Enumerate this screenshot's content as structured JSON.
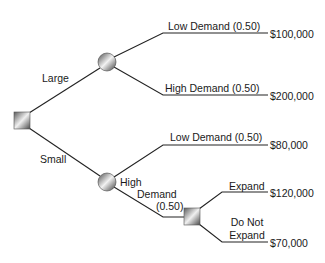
{
  "diagram": {
    "type": "decision-tree",
    "root": {
      "node_type": "decision",
      "branches": [
        {
          "label": "Large",
          "node_type": "chance",
          "outcomes": [
            {
              "label": "Low Demand (0.50)",
              "payoff": "$100,000"
            },
            {
              "label": "High Demand (0.50)",
              "payoff": "$200,000"
            }
          ]
        },
        {
          "label": "Small",
          "node_type": "chance",
          "outcomes": [
            {
              "label": "Low Demand (0.50)",
              "payoff": "$80,000"
            },
            {
              "label_lines": [
                "High",
                "Demand",
                "(0.50)"
              ],
              "node_type": "decision",
              "options": [
                {
                  "label": "Expand",
                  "payoff": "$120,000"
                },
                {
                  "label_lines": [
                    "Do Not",
                    "Expand"
                  ],
                  "payoff": "$70,000"
                }
              ]
            }
          ]
        }
      ]
    }
  },
  "colors": {
    "line": "#222222",
    "node_light": "#e8e8e8",
    "node_dark": "#555555"
  }
}
